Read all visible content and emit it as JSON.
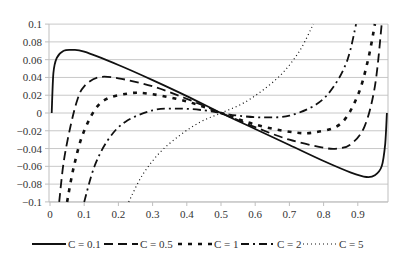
{
  "chart_data": {
    "type": "line",
    "title": "",
    "xlabel": "",
    "ylabel": "",
    "xlim": [
      0,
      0.99
    ],
    "ylim": [
      -0.1,
      0.1
    ],
    "grid": {
      "horizontal": true,
      "vertical": false
    },
    "legend_position": "bottom",
    "x_ticks": [
      "0",
      "0.1",
      "0.2",
      "0.3",
      "0.4",
      "0.5",
      "0.6",
      "0.7",
      "0.8",
      "0.9"
    ],
    "y_ticks": [
      "0.1",
      "0.08",
      "0.06",
      "0.04",
      "0.02",
      "0",
      "−0.02",
      "−0.04",
      "−0.06",
      "−0.08",
      "−0.1"
    ],
    "series": [
      {
        "name": "C = 0.1",
        "style": "solid",
        "x": [
          0.005,
          0.01,
          0.02,
          0.04,
          0.065,
          0.1,
          0.2,
          0.3,
          0.4,
          0.5,
          0.6,
          0.7,
          0.8,
          0.88,
          0.925,
          0.95,
          0.97,
          0.98,
          0.985
        ],
        "values": [
          0.0,
          0.045,
          0.062,
          0.07,
          0.071,
          0.069,
          0.054,
          0.037,
          0.019,
          0.0,
          -0.018,
          -0.036,
          -0.054,
          -0.067,
          -0.072,
          -0.07,
          -0.06,
          -0.035,
          0.0
        ]
      },
      {
        "name": "C = 0.5",
        "style": "long-dash",
        "x": [
          0.027,
          0.04,
          0.06,
          0.08,
          0.1,
          0.14,
          0.2,
          0.3,
          0.4,
          0.5,
          0.6,
          0.7,
          0.8,
          0.84,
          0.88,
          0.92,
          0.95,
          0.97
        ],
        "values": [
          -0.1,
          -0.055,
          -0.015,
          0.015,
          0.03,
          0.04,
          0.039,
          0.03,
          0.016,
          0.0,
          -0.016,
          -0.03,
          -0.039,
          -0.04,
          -0.035,
          -0.015,
          0.03,
          0.1
        ]
      },
      {
        "name": "C = 1",
        "style": "square-dot",
        "x": [
          0.05,
          0.07,
          0.1,
          0.15,
          0.23,
          0.3,
          0.4,
          0.5,
          0.6,
          0.7,
          0.77,
          0.85,
          0.9,
          0.93,
          0.95
        ],
        "values": [
          -0.1,
          -0.06,
          -0.02,
          0.012,
          0.022,
          0.021,
          0.013,
          0.0,
          -0.013,
          -0.021,
          -0.022,
          -0.012,
          0.02,
          0.06,
          0.1
        ]
      },
      {
        "name": "C = 2",
        "style": "dash-dot",
        "x": [
          0.1,
          0.13,
          0.17,
          0.22,
          0.3,
          0.38,
          0.45,
          0.5,
          0.55,
          0.62,
          0.7,
          0.78,
          0.83,
          0.87,
          0.895
        ],
        "values": [
          -0.1,
          -0.06,
          -0.03,
          -0.01,
          0.003,
          0.005,
          0.003,
          0.0,
          -0.003,
          -0.005,
          -0.003,
          0.01,
          0.03,
          0.06,
          0.1
        ]
      },
      {
        "name": "C = 5",
        "style": "dotted",
        "x": [
          0.23,
          0.27,
          0.32,
          0.38,
          0.44,
          0.5,
          0.56,
          0.62,
          0.68,
          0.73,
          0.77
        ],
        "values": [
          -0.1,
          -0.07,
          -0.045,
          -0.025,
          -0.01,
          0.0,
          0.01,
          0.025,
          0.045,
          0.07,
          0.1
        ]
      }
    ]
  },
  "colors": {
    "line": "#111111",
    "grid": "#c8c8c8",
    "axis": "#bfbfbf",
    "text": "#333333"
  }
}
